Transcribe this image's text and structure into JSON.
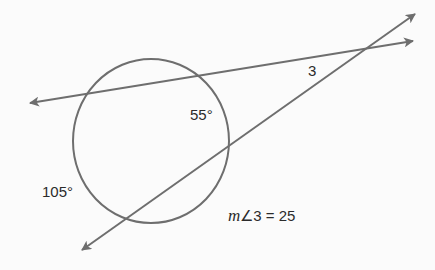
{
  "diagram": {
    "type": "circle with intersecting secant lines",
    "colors": {
      "background": "#fbfbfb",
      "stroke": "#6e6e6e",
      "text": "#2b2b2b"
    },
    "circle": {
      "cx": 151,
      "cy": 141,
      "rx": 78,
      "ry": 82
    },
    "lines": [
      {
        "name": "secant-upper",
        "from": [
          30,
          103
        ],
        "to": [
          413,
          41
        ],
        "arrows": "both"
      },
      {
        "name": "secant-lower",
        "from": [
          82,
          250
        ],
        "to": [
          415,
          14
        ],
        "arrows": "both"
      }
    ],
    "labels": {
      "arc_upper": "55°",
      "arc_lower": "105°",
      "angle": "3",
      "equation_m": "m",
      "equation_rest": "∠3 = 25"
    }
  }
}
